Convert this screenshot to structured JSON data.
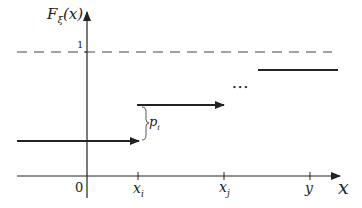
{
  "diagram": {
    "title_function": "F",
    "title_sub": "ξ",
    "title_arg": "(x)",
    "level_one_label": "1",
    "origin_label": "0",
    "xi_label": "x",
    "xi_sub": "i",
    "xj_label": "x",
    "xj_sub": "j",
    "y_label": "y",
    "x_axis_label": "x",
    "jump_label": "p",
    "jump_sub": "i",
    "ellipsis": "•••",
    "colors": {
      "line": "#222222",
      "dash": "#444444"
    }
  }
}
